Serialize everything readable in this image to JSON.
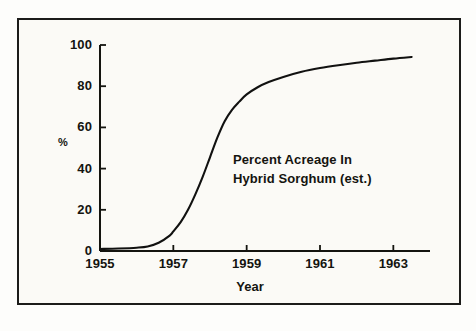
{
  "chart_data": {
    "type": "line",
    "title": "",
    "annotation": [
      "Percent Acreage In",
      "Hybrid Sorghum (est.)"
    ],
    "xlabel": "Year",
    "ylabel": "%",
    "xlim": [
      1955,
      1964
    ],
    "ylim": [
      0,
      100
    ],
    "grid": false,
    "legend": "none",
    "xticks": [
      1955,
      1957,
      1959,
      1961,
      1963
    ],
    "xtick_labels": [
      "1955",
      "1957",
      "1959",
      "1961",
      "1963"
    ],
    "yticks": [
      0,
      20,
      40,
      60,
      80,
      100
    ],
    "ytick_labels": [
      "0",
      "20",
      "40",
      "60",
      "80",
      "100"
    ],
    "line_color": "#111110",
    "series": [
      {
        "name": "Percent Acreage In Hybrid Sorghum (est.)",
        "x": [
          1955.0,
          1955.5,
          1956.0,
          1956.3,
          1956.6,
          1956.9,
          1957.0,
          1957.2,
          1957.4,
          1957.6,
          1957.8,
          1958.0,
          1958.2,
          1958.4,
          1958.6,
          1958.8,
          1959.0,
          1959.3,
          1959.6,
          1960.0,
          1960.5,
          1961.0,
          1961.5,
          1962.0,
          1962.5,
          1963.0,
          1963.5
        ],
        "y": [
          1.0,
          1.2,
          1.6,
          2.2,
          4.0,
          7.5,
          9.5,
          14.0,
          20.0,
          27.5,
          36.0,
          45.5,
          55.0,
          63.0,
          68.5,
          72.5,
          76.0,
          79.5,
          82.0,
          84.5,
          87.0,
          88.8,
          90.2,
          91.4,
          92.4,
          93.4,
          94.2
        ]
      }
    ]
  },
  "axis_geometry": {
    "left_px": 100,
    "right_px": 430,
    "bottom_px": 251,
    "top_px": 45
  },
  "colors": {
    "ink": "#14140f",
    "frame": "#1c1c1a",
    "paper": "#fbfaf6",
    "curve": "#111110"
  }
}
